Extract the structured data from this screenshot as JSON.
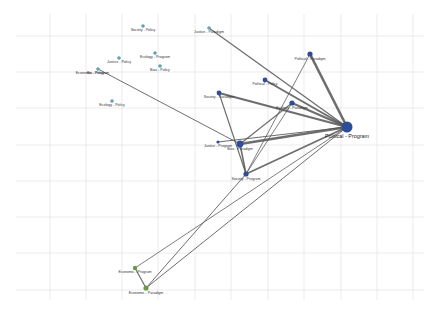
{
  "diagram": {
    "type": "network-graph",
    "grid": {
      "x_lines": [
        50,
        86,
        122,
        158,
        195,
        231,
        268,
        304,
        341,
        377,
        413
      ],
      "y_lines": [
        36,
        72,
        108,
        145,
        181,
        217,
        253,
        290
      ],
      "x_start": 16,
      "x_end": 424,
      "y_start": 14,
      "y_end": 300,
      "color": "#e3e3e3"
    },
    "colors": {
      "policy_node": "#5fa3b5",
      "core_node": "#2e4d98",
      "economic_node": "#6a9a48",
      "edge": "#555555",
      "label": "#333333"
    },
    "nodes": [
      {
        "id": "society-policy",
        "label": "Society - Policy",
        "x": 143,
        "y": 26,
        "r": 1.8,
        "group": "policy_node"
      },
      {
        "id": "justice-paradigm",
        "label": "Justice - Paradigm",
        "x": 209,
        "y": 28,
        "r": 1.8,
        "group": "policy_node"
      },
      {
        "id": "ecology-program",
        "label": "Ecology - Program",
        "x": 155,
        "y": 53,
        "r": 1.8,
        "group": "policy_node"
      },
      {
        "id": "justice-policy",
        "label": "Justice - Policy",
        "x": 119,
        "y": 58,
        "r": 1.8,
        "group": "policy_node"
      },
      {
        "id": "bias-policy",
        "label": "Bias - Policy",
        "x": 160,
        "y": 66,
        "r": 1.8,
        "group": "policy_node"
      },
      {
        "id": "bio-program",
        "label": "Bio - Program",
        "x": 98,
        "y": 69,
        "r": 1.8,
        "group": "policy_node"
      },
      {
        "id": "economic-policy",
        "label": "Economic - Policy",
        "x": 90,
        "y": 72,
        "r": 0,
        "group": "policy_node"
      },
      {
        "id": "ecology-policy",
        "label": "Ecology - Policy",
        "x": 112,
        "y": 101,
        "r": 1.8,
        "group": "policy_node"
      },
      {
        "id": "political-paradigm",
        "label": "Political - Paradigm",
        "x": 310,
        "y": 54,
        "r": 2.6,
        "group": "core_node"
      },
      {
        "id": "political-policy",
        "label": "Political - Policy",
        "x": 265,
        "y": 80,
        "r": 2.4,
        "group": "core_node"
      },
      {
        "id": "society-paradigm",
        "label": "Society - Paradigm",
        "x": 219,
        "y": 93,
        "r": 2.4,
        "group": "core_node"
      },
      {
        "id": "ecology-paradigm",
        "label": "Ecology - Paradigm",
        "x": 292,
        "y": 103,
        "r": 2.6,
        "group": "core_node"
      },
      {
        "id": "political-program",
        "label": "Political - Program",
        "x": 347,
        "y": 127,
        "r": 5.5,
        "group": "core_node",
        "big": true
      },
      {
        "id": "justice-program",
        "label": "Justice - Program",
        "x": 218,
        "y": 142,
        "r": 1.6,
        "group": "core_node"
      },
      {
        "id": "bias-paradigm",
        "label": "Bias - Paradigm",
        "x": 240,
        "y": 144,
        "r": 3.4,
        "group": "core_node"
      },
      {
        "id": "society-program",
        "label": "Society - Program",
        "x": 246,
        "y": 174,
        "r": 2.6,
        "group": "core_node"
      },
      {
        "id": "economic-program",
        "label": "Economic - Program",
        "x": 135,
        "y": 268,
        "r": 2.2,
        "group": "economic_node"
      },
      {
        "id": "economic-paradigm",
        "label": "Economic - Paradigm",
        "x": 146,
        "y": 288,
        "r": 2.6,
        "group": "economic_node"
      }
    ],
    "edges": [
      {
        "from": "justice-paradigm",
        "to": "political-program",
        "w": 1.3
      },
      {
        "from": "political-paradigm",
        "to": "political-program",
        "w": 2.6
      },
      {
        "from": "political-paradigm",
        "to": "society-program",
        "w": 0.9
      },
      {
        "from": "political-policy",
        "to": "political-program",
        "w": 2.0
      },
      {
        "from": "society-paradigm",
        "to": "political-program",
        "w": 2.2
      },
      {
        "from": "society-paradigm",
        "to": "society-program",
        "w": 1.2
      },
      {
        "from": "ecology-paradigm",
        "to": "political-program",
        "w": 2.0
      },
      {
        "from": "ecology-paradigm",
        "to": "bias-paradigm",
        "w": 1.2
      },
      {
        "from": "ecology-paradigm",
        "to": "society-program",
        "w": 0.9
      },
      {
        "from": "bio-program",
        "to": "bias-paradigm",
        "w": 1.0
      },
      {
        "from": "justice-program",
        "to": "political-program",
        "w": 1.2
      },
      {
        "from": "bias-paradigm",
        "to": "political-program",
        "w": 2.4
      },
      {
        "from": "bias-paradigm",
        "to": "society-program",
        "w": 1.6
      },
      {
        "from": "society-program",
        "to": "political-program",
        "w": 1.8
      },
      {
        "from": "economic-program",
        "to": "political-program",
        "w": 0.9
      },
      {
        "from": "economic-paradigm",
        "to": "political-program",
        "w": 1.0
      },
      {
        "from": "economic-paradigm",
        "to": "society-program",
        "w": 1.0
      },
      {
        "from": "economic-program",
        "to": "economic-paradigm",
        "w": 1.2
      }
    ]
  }
}
